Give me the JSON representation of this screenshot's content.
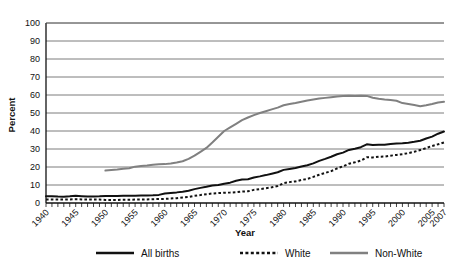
{
  "chart_data": {
    "type": "line",
    "title": "",
    "xlabel": "Year",
    "ylabel": "Percent",
    "xlim": [
      1940,
      2007
    ],
    "ylim": [
      0,
      100
    ],
    "grid": true,
    "legend_position": "bottom",
    "ytick_labels": [
      "0",
      "10",
      "20",
      "30",
      "40",
      "50",
      "60",
      "70",
      "80",
      "90",
      "100"
    ],
    "ytick_values": [
      0,
      10,
      20,
      30,
      40,
      50,
      60,
      70,
      80,
      90,
      100
    ],
    "xtick_labels": [
      "1940",
      "1945",
      "1950",
      "1955",
      "1960",
      "1965",
      "1970",
      "1975",
      "1980",
      "1985",
      "1990",
      "1995",
      "2000",
      "2005",
      "2007"
    ],
    "xtick_values": [
      1940,
      1945,
      1950,
      1955,
      1960,
      1965,
      1970,
      1975,
      1980,
      1985,
      1990,
      1995,
      2000,
      2005,
      2007
    ],
    "x_minor_step": 1,
    "series": [
      {
        "name": "All births",
        "style": "solid",
        "color": "#111111",
        "width": 2.0,
        "x": [
          1940,
          1941,
          1942,
          1943,
          1944,
          1945,
          1946,
          1947,
          1948,
          1949,
          1950,
          1951,
          1952,
          1953,
          1954,
          1955,
          1956,
          1957,
          1958,
          1959,
          1960,
          1961,
          1962,
          1963,
          1964,
          1965,
          1966,
          1967,
          1968,
          1969,
          1970,
          1971,
          1972,
          1973,
          1974,
          1975,
          1976,
          1977,
          1978,
          1979,
          1980,
          1981,
          1982,
          1983,
          1984,
          1985,
          1986,
          1987,
          1988,
          1989,
          1990,
          1991,
          1992,
          1993,
          1994,
          1995,
          1996,
          1997,
          1998,
          1999,
          2000,
          2001,
          2002,
          2003,
          2004,
          2005,
          2006,
          2007
        ],
        "values": [
          3.8,
          3.8,
          3.6,
          3.5,
          3.7,
          4.0,
          3.8,
          3.6,
          3.6,
          3.7,
          3.9,
          3.9,
          3.9,
          4.0,
          4.0,
          4.0,
          4.1,
          4.2,
          4.3,
          4.5,
          5.3,
          5.6,
          5.9,
          6.3,
          6.8,
          7.7,
          8.4,
          9.0,
          9.7,
          10.0,
          10.7,
          11.3,
          12.4,
          13.0,
          13.2,
          14.2,
          14.8,
          15.5,
          16.3,
          17.1,
          18.4,
          18.9,
          19.4,
          20.3,
          21.0,
          22.0,
          23.4,
          24.5,
          25.7,
          27.1,
          28.0,
          29.5,
          30.1,
          31.0,
          32.6,
          32.2,
          32.4,
          32.4,
          32.8,
          33.0,
          33.2,
          33.5,
          34.0,
          34.6,
          35.8,
          36.9,
          38.5,
          39.7
        ]
      },
      {
        "name": "White",
        "style": "dotted",
        "color": "#111111",
        "width": 2.0,
        "x": [
          1940,
          1941,
          1942,
          1943,
          1944,
          1945,
          1946,
          1947,
          1948,
          1949,
          1950,
          1951,
          1952,
          1953,
          1954,
          1955,
          1956,
          1957,
          1958,
          1959,
          1960,
          1961,
          1962,
          1963,
          1964,
          1965,
          1966,
          1967,
          1968,
          1969,
          1970,
          1971,
          1972,
          1973,
          1974,
          1975,
          1976,
          1977,
          1978,
          1979,
          1980,
          1981,
          1982,
          1983,
          1984,
          1985,
          1986,
          1987,
          1988,
          1989,
          1990,
          1991,
          1992,
          1993,
          1994,
          1995,
          1996,
          1997,
          1998,
          1999,
          2000,
          2001,
          2002,
          2003,
          2004,
          2005,
          2006,
          2007
        ],
        "values": [
          2.0,
          2.0,
          1.9,
          1.9,
          2.0,
          2.1,
          2.0,
          1.9,
          1.9,
          1.9,
          1.7,
          1.7,
          1.7,
          1.8,
          1.8,
          1.9,
          1.9,
          2.0,
          2.1,
          2.2,
          2.3,
          2.5,
          2.7,
          3.1,
          3.4,
          4.0,
          4.4,
          4.9,
          5.3,
          5.5,
          5.7,
          5.8,
          6.0,
          6.4,
          6.5,
          7.3,
          7.7,
          8.2,
          8.7,
          9.4,
          11.0,
          11.6,
          12.0,
          12.8,
          13.4,
          14.5,
          15.7,
          16.7,
          17.7,
          19.2,
          20.4,
          21.8,
          22.6,
          23.6,
          25.4,
          25.3,
          25.7,
          25.8,
          26.3,
          26.7,
          27.1,
          27.7,
          28.5,
          29.4,
          30.5,
          31.7,
          32.6,
          33.6
        ]
      },
      {
        "name": "Non-White",
        "style": "solid",
        "color": "#808080",
        "width": 2.0,
        "x": [
          1950,
          1951,
          1952,
          1953,
          1954,
          1955,
          1956,
          1957,
          1958,
          1959,
          1960,
          1961,
          1962,
          1963,
          1964,
          1965,
          1966,
          1967,
          1968,
          1969,
          1970,
          1971,
          1972,
          1973,
          1974,
          1975,
          1976,
          1977,
          1978,
          1979,
          1980,
          1981,
          1982,
          1983,
          1984,
          1985,
          1986,
          1987,
          1988,
          1989,
          1990,
          1991,
          1992,
          1993,
          1994,
          1995,
          1996,
          1997,
          1998,
          1999,
          2000,
          2001,
          2002,
          2003,
          2004,
          2005,
          2006,
          2007
        ],
        "values": [
          18.0,
          18.3,
          18.6,
          19.0,
          19.3,
          20.2,
          20.5,
          20.8,
          21.2,
          21.5,
          21.6,
          22.0,
          22.5,
          23.2,
          24.5,
          26.3,
          28.4,
          30.6,
          33.6,
          36.8,
          40.0,
          42.0,
          44.0,
          46.0,
          47.5,
          48.8,
          50.0,
          51.0,
          52.0,
          53.0,
          54.3,
          55.0,
          55.6,
          56.3,
          57.0,
          57.5,
          58.0,
          58.4,
          58.8,
          59.2,
          59.4,
          59.6,
          59.5,
          59.6,
          59.5,
          58.5,
          57.9,
          57.5,
          57.2,
          56.8,
          55.5,
          55.0,
          54.4,
          53.8,
          54.3,
          55.0,
          55.8,
          56.2
        ]
      }
    ]
  },
  "legend": {
    "items": [
      {
        "label": "All births",
        "swatch": "solid-black-line"
      },
      {
        "label": "White",
        "swatch": "dotted-black-line"
      },
      {
        "label": "Non-White",
        "swatch": "solid-gray-line"
      }
    ]
  }
}
